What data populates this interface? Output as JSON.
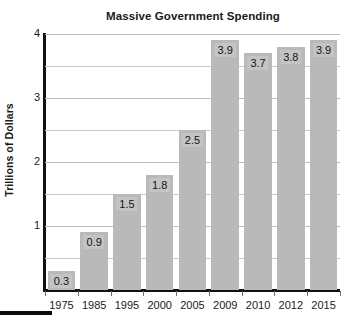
{
  "chart_data": {
    "type": "bar",
    "title": "Massive Government Spending",
    "xlabel": "",
    "ylabel": "Trillions of Dollars",
    "categories": [
      "1975",
      "1985",
      "1995",
      "2000",
      "2005",
      "2009",
      "2010",
      "2012",
      "2015"
    ],
    "values": [
      0.3,
      0.9,
      1.5,
      1.8,
      2.5,
      3.9,
      3.7,
      3.8,
      3.9
    ],
    "value_labels": [
      "0.3",
      "0.9",
      "1.5",
      "1.8",
      "2.5",
      "3.9",
      "3.7",
      "3.8",
      "3.9"
    ],
    "ylim": [
      0,
      4
    ],
    "y_major_ticks": [
      1,
      2,
      3,
      4
    ],
    "y_major_tick_labels": [
      "1",
      "2",
      "3",
      "4"
    ],
    "y_minor_ticks": [
      0.5,
      1.5,
      2.5,
      3.5
    ],
    "grid": true,
    "legend": "none",
    "bar_color": "#b9b9b9",
    "value_label_bg": "#c4c4c4",
    "axis_color": "#111111",
    "gridline_color": "#c9c9c9",
    "background": "#ffffff"
  },
  "footer": {
    "marker_color": "#0a0a0a"
  }
}
